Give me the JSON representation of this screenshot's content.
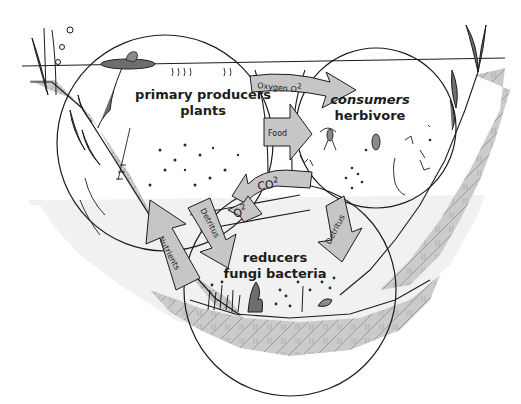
{
  "groups": {
    "producers": {
      "line1": "primary producers",
      "line2": "plants"
    },
    "consumers": {
      "line1": "consumers",
      "line2": "herbivore"
    },
    "reducers": {
      "line1": "reducers",
      "line2": "fungi bacteria"
    }
  },
  "arrows": {
    "oxygen": "Oxygen O",
    "oxygen_sup": "2",
    "food": "Food",
    "co2": "CO",
    "co2_sup": "2",
    "o2": "O",
    "o2_sup": "2",
    "detritus_left": "Detritus",
    "detritus_right": "Detritus",
    "nutrients": "Nutrients"
  },
  "colors": {
    "water": "#f2f2f2",
    "soil": "#c9c9c9",
    "soil_hatch": "#8c8c8c",
    "arrow_fill": "#c6c6c6",
    "outline": "#1c1c1c",
    "plant": "#6e6e6e"
  }
}
